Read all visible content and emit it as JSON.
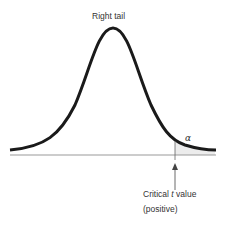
{
  "diagram": {
    "title": "Right tail",
    "tail_label": "α",
    "critical_label_line1_pre": "Critical ",
    "critical_label_var": "t",
    "critical_label_line1_post": " value",
    "critical_label_line2": "(positive)",
    "colors": {
      "curve": "#1a1a1a",
      "baseline": "#999999",
      "shade": "#e8e8e8",
      "text": "#333333"
    }
  }
}
